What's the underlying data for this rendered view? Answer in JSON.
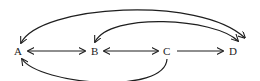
{
  "diagram": {
    "nodes": [
      {
        "id": "A",
        "label": "A",
        "x": 18,
        "y": 51
      },
      {
        "id": "B",
        "label": "B",
        "x": 95,
        "y": 51
      },
      {
        "id": "C",
        "label": "C",
        "x": 167,
        "y": 51
      },
      {
        "id": "D",
        "label": "D",
        "x": 233,
        "y": 51
      }
    ],
    "edges": [
      {
        "from": "A",
        "to": "B",
        "type": "straight",
        "direction": "both"
      },
      {
        "from": "B",
        "to": "C",
        "type": "straight",
        "direction": "both"
      },
      {
        "from": "C",
        "to": "D",
        "type": "straight",
        "direction": "forward"
      },
      {
        "from": "A",
        "to": "D",
        "type": "curve-top-outer",
        "direction": "both"
      },
      {
        "from": "B",
        "to": "D",
        "type": "curve-top-inner",
        "direction": "both"
      },
      {
        "from": "C",
        "to": "A",
        "type": "curve-bottom",
        "direction": "forward"
      }
    ],
    "colors": {
      "stroke": "#1e1e1e",
      "text": "#222222",
      "background": "#ffffff"
    }
  }
}
